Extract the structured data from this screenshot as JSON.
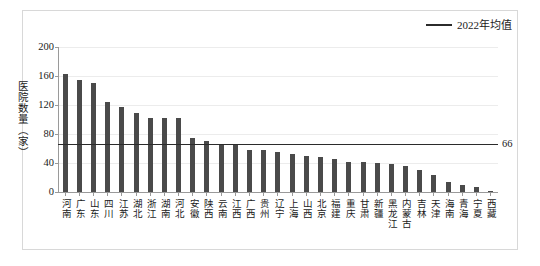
{
  "legend": {
    "marker": "line-marker",
    "label": "2022年均值"
  },
  "axis": {
    "y_title": "医院数量（家）",
    "y_ticks": [
      "0",
      "40",
      "80",
      "120",
      "160",
      "200"
    ]
  },
  "average": {
    "value_label": "66",
    "value": 66
  },
  "chart_data": {
    "type": "bar",
    "title": "",
    "subtitle": "",
    "xlabel": "",
    "ylabel": "医院数量（家）",
    "ylim": [
      0,
      200
    ],
    "ytick_values": [
      0,
      40,
      80,
      120,
      160,
      200
    ],
    "grid": true,
    "legend_position": "top-right",
    "categories": [
      "河南",
      "广东",
      "山东",
      "四川",
      "江苏",
      "湖北",
      "浙江",
      "湖南",
      "河北",
      "安徽",
      "陕西",
      "云南",
      "江西",
      "广西",
      "贵州",
      "辽宁",
      "上海",
      "山西",
      "北京",
      "福建",
      "重庆",
      "甘肃",
      "新疆",
      "黑龙江",
      "内蒙古",
      "吉林",
      "天津",
      "海南",
      "青海",
      "宁夏",
      "西藏"
    ],
    "series": [
      {
        "name": "医院数量",
        "values": [
          163,
          155,
          150,
          124,
          117,
          109,
          102,
          102,
          102,
          75,
          70,
          66,
          66,
          58,
          58,
          55,
          53,
          50,
          48,
          46,
          42,
          42,
          40,
          38,
          36,
          30,
          24,
          14,
          9,
          7,
          2
        ]
      }
    ],
    "reference_line": {
      "name": "2022年均值",
      "value": 66,
      "label": "66"
    }
  }
}
